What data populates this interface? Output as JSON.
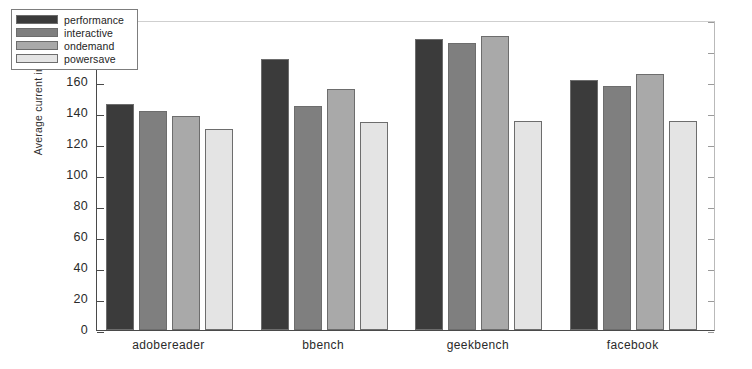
{
  "chart_data": {
    "type": "bar",
    "title": "",
    "xlabel": "",
    "ylabel": "Average current in mA",
    "ylim": [
      0,
      200
    ],
    "ytick_step": 20,
    "yticks": [
      0,
      20,
      40,
      60,
      80,
      100,
      120,
      140,
      160,
      180,
      200
    ],
    "grid": false,
    "legend_position": "upper left",
    "categories": [
      "adobereader",
      "bbench",
      "geekbench",
      "facebook"
    ],
    "series": [
      {
        "name": "performance",
        "color": "#3b3b3b",
        "values": [
          146,
          175,
          188,
          161.5
        ]
      },
      {
        "name": "interactive",
        "color": "#7f7f7f",
        "values": [
          141.5,
          144.5,
          185,
          157.5
        ]
      },
      {
        "name": "ondemand",
        "color": "#a9a9a9",
        "values": [
          138,
          155.5,
          190,
          165
        ]
      },
      {
        "name": "powersave",
        "color": "#e4e4e4",
        "values": [
          130,
          134.5,
          135,
          135
        ]
      }
    ]
  },
  "axes": {
    "y_title": "Average current in mA",
    "tick_labels": [
      "0",
      "20",
      "40",
      "60",
      "80",
      "100",
      "120",
      "140",
      "160",
      "180",
      "200"
    ],
    "category_labels": [
      "adobereader",
      "bbench",
      "geekbench",
      "facebook"
    ]
  },
  "legend": {
    "entries": [
      {
        "label": "performance",
        "color": "#3b3b3b"
      },
      {
        "label": "interactive",
        "color": "#7f7f7f"
      },
      {
        "label": "ondemand",
        "color": "#a9a9a9"
      },
      {
        "label": "powersave",
        "color": "#e4e4e4"
      }
    ]
  }
}
